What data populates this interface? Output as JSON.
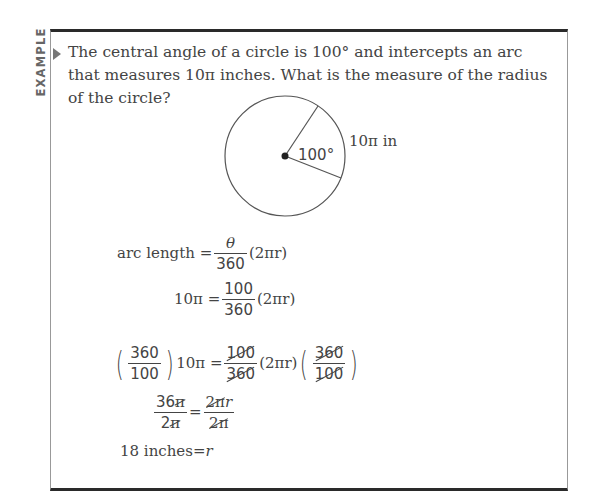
{
  "side_label": "EXAMPLE",
  "question": "The central angle of a circle is 100° and intercepts an arc that measures 10π inches. What is the measure of the radius of the circle?",
  "diagram": {
    "angle_label": "100°",
    "arc_label": "10π in"
  },
  "solution": {
    "line1": {
      "lhs": "arc length",
      "eq": "=",
      "num": "θ",
      "den": "360",
      "tail": "(2πr)"
    },
    "line2": {
      "lhs": "10π",
      "eq": "=",
      "num": "100",
      "den": "360",
      "tail": "(2πr)"
    },
    "line3": {
      "lp_num": "360",
      "lp_den": "100",
      "lhs": "10π",
      "eq": "=",
      "num": "100",
      "den": "360",
      "mid": "(2πr)",
      "rp_num": "360",
      "rp_den": "100"
    },
    "line4": {
      "l_num_a": "36",
      "l_num_b": "π",
      "l_den_a": "2",
      "l_den_b": "π",
      "eq": "=",
      "r_num_a": "2π",
      "r_num_b": "r",
      "r_den": "2π"
    },
    "line5": {
      "lhs": "18 inches",
      "eq": "=",
      "rhs": "r"
    }
  }
}
